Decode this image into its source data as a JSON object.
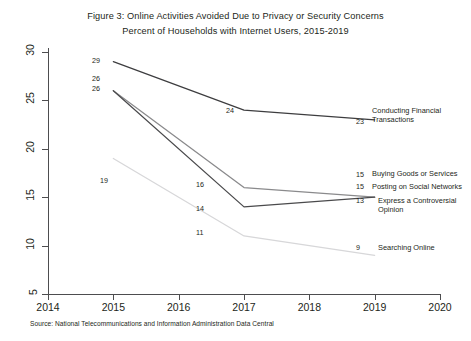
{
  "title": {
    "line1": "Figure 3: Online Activities Avoided Due to Privacy or Security Concerns",
    "line2": "Percent of Households with Internet Users, 2015-2019"
  },
  "source": "Source: National Telecommunications and Information Administration Data Central",
  "axes": {
    "x_ticks": [
      "2014",
      "2015",
      "2016",
      "2017",
      "2018",
      "2019",
      "2020"
    ],
    "y_ticks": [
      "5",
      "10",
      "15",
      "20",
      "25",
      "30"
    ]
  },
  "chart_data": {
    "type": "line",
    "title": "Figure 3: Online Activities Avoided Due to Privacy or Security Concerns",
    "subtitle": "Percent of Households with Internet Users, 2015-2019",
    "xlabel": "",
    "ylabel": "Percent of Households with Internet Users",
    "xlim": [
      2014,
      2020
    ],
    "ylim": [
      5,
      30
    ],
    "x_ticks": [
      2014,
      2015,
      2016,
      2017,
      2018,
      2019,
      2020
    ],
    "y_ticks": [
      5,
      10,
      15,
      20,
      25,
      30
    ],
    "grid": false,
    "legend": "inline-right-labels",
    "series": [
      {
        "name": "Conducting Financial Transactions",
        "color": "#3d3d3f",
        "x": [
          2015,
          2017,
          2019
        ],
        "values": [
          29,
          24,
          23
        ],
        "labels": [
          "29",
          "24",
          "23"
        ]
      },
      {
        "name": "Posting on Social Networks",
        "color": "#8a8a8c",
        "x": [
          2015,
          2017,
          2019
        ],
        "values": [
          26,
          16,
          15
        ],
        "labels": [
          "26",
          "16",
          "15"
        ]
      },
      {
        "name": "Buying Goods or Services",
        "color": "#4a4a4c",
        "x": [
          2015,
          2017,
          2019
        ],
        "values": [
          26,
          14,
          15
        ],
        "labels": [
          "26",
          "14",
          "15"
        ]
      },
      {
        "name": "Express a Controversial Opinion",
        "color": "#bdbdbf",
        "x": [
          2019
        ],
        "values": [
          13
        ],
        "labels": [
          "13"
        ]
      },
      {
        "name": "Searching Online",
        "color": "#d7d7d9",
        "x": [
          2015,
          2017,
          2019
        ],
        "values": [
          19,
          11,
          9
        ],
        "labels": [
          "19",
          "11",
          "9"
        ]
      }
    ]
  },
  "point_labels": [
    {
      "text": "29",
      "x": 92,
      "y": 56,
      "name": "point-label-financial-2015"
    },
    {
      "text": "26",
      "x": 92,
      "y": 74,
      "name": "point-label-social-2015"
    },
    {
      "text": "26",
      "x": 92,
      "y": 84,
      "name": "point-label-buying-2015"
    },
    {
      "text": "19",
      "x": 100,
      "y": 176,
      "name": "point-label-searching-2015"
    },
    {
      "text": "24",
      "x": 226,
      "y": 106,
      "name": "point-label-financial-2017"
    },
    {
      "text": "16",
      "x": 196,
      "y": 180,
      "name": "point-label-social-2017"
    },
    {
      "text": "14",
      "x": 196,
      "y": 204,
      "name": "point-label-buying-2017"
    },
    {
      "text": "11",
      "x": 196,
      "y": 228,
      "name": "point-label-searching-2017"
    },
    {
      "text": "23",
      "x": 356,
      "y": 117,
      "name": "point-label-financial-2019"
    },
    {
      "text": "15",
      "x": 356,
      "y": 170,
      "name": "point-label-buying-2019"
    },
    {
      "text": "15",
      "x": 356,
      "y": 182,
      "name": "point-label-social-2019"
    },
    {
      "text": "13",
      "x": 356,
      "y": 196,
      "name": "point-label-express-2019"
    },
    {
      "text": "9",
      "x": 356,
      "y": 243,
      "name": "point-label-searching-2019"
    }
  ],
  "series_captions": [
    {
      "text": "Conducting Financial\nTransactions",
      "x": 372,
      "y": 106,
      "name": "series-caption-financial"
    },
    {
      "text": "Buying Goods or Services",
      "x": 372,
      "y": 169,
      "name": "series-caption-buying"
    },
    {
      "text": "Posting on Social Networks",
      "x": 372,
      "y": 182,
      "name": "series-caption-social"
    },
    {
      "text": "Express a Controversial\nOpinion",
      "x": 378,
      "y": 196,
      "name": "series-caption-express"
    },
    {
      "text": "Searching Online",
      "x": 378,
      "y": 243,
      "name": "series-caption-searching"
    }
  ]
}
